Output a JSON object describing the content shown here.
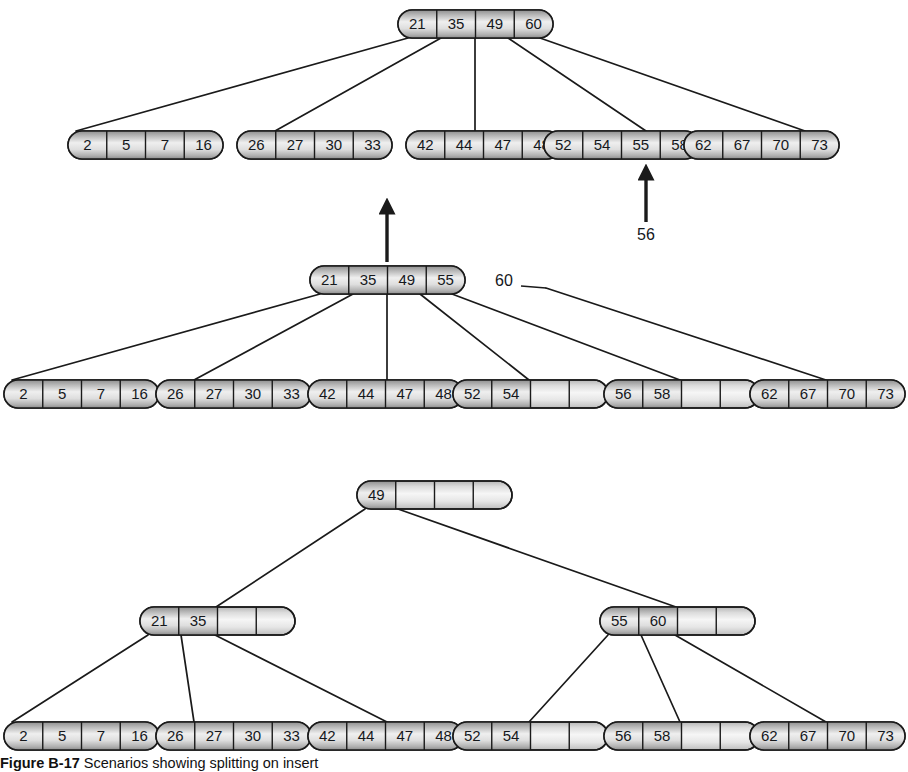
{
  "figure": {
    "caption_label": "Figure B-17",
    "caption_text": "Scenarios showing splitting on insert",
    "background_color": "#ffffff",
    "node_fill_light": "#f2f2f2",
    "node_fill_shade": "#9a9a9a",
    "stroke_color": "#1a1a1a"
  },
  "trees": [
    {
      "name": "tree-before-insert",
      "levels": [
        {
          "name": "root-level",
          "nodes": [
            {
              "name": "root-node",
              "cells": [
                "21",
                "35",
                "49",
                "60"
              ],
              "x": 398,
              "y": 10
            }
          ]
        },
        {
          "name": "leaf-level",
          "nodes": [
            {
              "name": "leaf-node-1",
              "cells": [
                "2",
                "5",
                "7",
                "16"
              ],
              "x": 68,
              "y": 131
            },
            {
              "name": "leaf-node-2",
              "cells": [
                "26",
                "27",
                "30",
                "33"
              ],
              "x": 237,
              "y": 131
            },
            {
              "name": "leaf-node-3",
              "cells": [
                "42",
                "44",
                "47",
                "48"
              ],
              "x": 406,
              "y": 131
            },
            {
              "name": "leaf-node-4",
              "cells": [
                "52",
                "54",
                "55",
                "58"
              ],
              "x": 544,
              "y": 131
            },
            {
              "name": "leaf-node-5",
              "cells": [
                "62",
                "67",
                "70",
                "73"
              ],
              "x": 684,
              "y": 131
            }
          ]
        }
      ],
      "edges": [
        {
          "from": [
            408,
            38
          ],
          "to": [
            76,
            131
          ]
        },
        {
          "from": [
            441,
            38
          ],
          "to": [
            275,
            131
          ]
        },
        {
          "from": [
            475,
            38
          ],
          "to": [
            475,
            131
          ]
        },
        {
          "from": [
            508,
            38
          ],
          "to": [
            646,
            131
          ]
        },
        {
          "from": [
            540,
            38
          ],
          "to": [
            805,
            131
          ]
        }
      ],
      "annotations": [
        {
          "name": "insert-arrow-56",
          "type": "arrow-up",
          "x": 646,
          "y_tip": 172,
          "y_base": 222
        },
        {
          "name": "insert-label-56",
          "type": "label",
          "text": "56",
          "x": 646,
          "y": 236
        }
      ]
    },
    {
      "name": "tree-after-leaf-split",
      "levels": [
        {
          "name": "root-level",
          "nodes": [
            {
              "name": "root-node",
              "cells": [
                "21",
                "35",
                "49",
                "55"
              ],
              "x": 310,
              "y": 266
            }
          ]
        },
        {
          "name": "leaf-level",
          "nodes": [
            {
              "name": "leaf-node-1",
              "cells": [
                "2",
                "5",
                "7",
                "16"
              ],
              "x": 4,
              "y": 380
            },
            {
              "name": "leaf-node-2",
              "cells": [
                "26",
                "27",
                "30",
                "33"
              ],
              "x": 156,
              "y": 380
            },
            {
              "name": "leaf-node-3",
              "cells": [
                "42",
                "44",
                "47",
                "48"
              ],
              "x": 308,
              "y": 380
            },
            {
              "name": "leaf-node-4",
              "cells": [
                "52",
                "54",
                "",
                ""
              ],
              "x": 453,
              "y": 380
            },
            {
              "name": "leaf-node-5",
              "cells": [
                "56",
                "58",
                "",
                ""
              ],
              "x": 604,
              "y": 380
            },
            {
              "name": "leaf-node-6",
              "cells": [
                "62",
                "67",
                "70",
                "73"
              ],
              "x": 750,
              "y": 380
            }
          ]
        }
      ],
      "edges": [
        {
          "from": [
            320,
            294
          ],
          "to": [
            12,
            380
          ]
        },
        {
          "from": [
            353,
            294
          ],
          "to": [
            194,
            380
          ]
        },
        {
          "from": [
            387,
            294
          ],
          "to": [
            387,
            380
          ]
        },
        {
          "from": [
            420,
            294
          ],
          "to": [
            529,
            380
          ]
        },
        {
          "from": [
            452,
            294
          ],
          "to": [
            680,
            380
          ]
        },
        {
          "from": [
            546,
            288
          ],
          "to": [
            826,
            380
          ]
        }
      ],
      "annotations": [
        {
          "name": "overflow-arrow",
          "type": "arrow-up",
          "x": 387,
          "y_tip": 206,
          "y_base": 262
        },
        {
          "name": "promoted-key-label-60",
          "type": "label",
          "text": "60",
          "x": 504,
          "y": 282
        },
        {
          "name": "promoted-key-leader",
          "type": "leader-line",
          "from": [
            521,
            286
          ],
          "to": [
            546,
            288
          ]
        }
      ]
    },
    {
      "name": "tree-after-root-split",
      "levels": [
        {
          "name": "root-level",
          "nodes": [
            {
              "name": "root-node",
              "cells": [
                "49",
                "",
                "",
                ""
              ],
              "x": 357,
              "y": 481
            }
          ]
        },
        {
          "name": "internal-level",
          "nodes": [
            {
              "name": "internal-node-left",
              "cells": [
                "21",
                "35",
                "",
                ""
              ],
              "x": 140,
              "y": 607
            },
            {
              "name": "internal-node-right",
              "cells": [
                "55",
                "60",
                "",
                ""
              ],
              "x": 600,
              "y": 607
            }
          ]
        },
        {
          "name": "leaf-level",
          "nodes": [
            {
              "name": "leaf-node-1",
              "cells": [
                "2",
                "5",
                "7",
                "16"
              ],
              "x": 4,
              "y": 722
            },
            {
              "name": "leaf-node-2",
              "cells": [
                "26",
                "27",
                "30",
                "33"
              ],
              "x": 156,
              "y": 722
            },
            {
              "name": "leaf-node-3",
              "cells": [
                "42",
                "44",
                "47",
                "48"
              ],
              "x": 308,
              "y": 722
            },
            {
              "name": "leaf-node-4",
              "cells": [
                "52",
                "54",
                "",
                ""
              ],
              "x": 453,
              "y": 722
            },
            {
              "name": "leaf-node-5",
              "cells": [
                "56",
                "58",
                "",
                ""
              ],
              "x": 604,
              "y": 722
            },
            {
              "name": "leaf-node-6",
              "cells": [
                "62",
                "67",
                "70",
                "73"
              ],
              "x": 750,
              "y": 722
            }
          ]
        }
      ],
      "edges": [
        {
          "from": [
            365,
            509
          ],
          "to": [
            216,
            607
          ]
        },
        {
          "from": [
            398,
            509
          ],
          "to": [
            676,
            607
          ]
        },
        {
          "from": [
            148,
            635
          ],
          "to": [
            12,
            722
          ]
        },
        {
          "from": [
            181,
            635
          ],
          "to": [
            194,
            722
          ]
        },
        {
          "from": [
            215,
            635
          ],
          "to": [
            387,
            722
          ]
        },
        {
          "from": [
            608,
            635
          ],
          "to": [
            529,
            722
          ]
        },
        {
          "from": [
            641,
            635
          ],
          "to": [
            680,
            722
          ]
        },
        {
          "from": [
            675,
            635
          ],
          "to": [
            826,
            722
          ]
        }
      ],
      "annotations": []
    }
  ],
  "geometry": {
    "node_width": 155,
    "node_height": 28,
    "cell_count": 4
  }
}
